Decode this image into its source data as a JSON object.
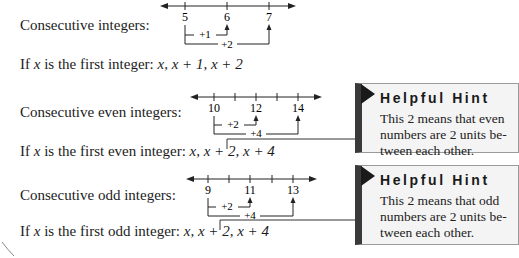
{
  "sections": [
    {
      "id": "consecutive",
      "label": "Consecutive integers:",
      "formula_prefix": "If ",
      "formula_var": "x",
      "formula_mid": " is the first integer: ",
      "formula_terms": "x, x + 1, x + 2",
      "number_line": {
        "tick_labels": [
          "5",
          "6",
          "7"
        ],
        "step_labels": [
          "+1",
          "+2"
        ]
      }
    },
    {
      "id": "even",
      "label": "Consecutive even integers:",
      "formula_prefix": "If ",
      "formula_var": "x",
      "formula_mid": " is the first even integer: ",
      "formula_terms": "x, x + 2, x + 4",
      "number_line": {
        "tick_labels": [
          "10",
          "12",
          "14"
        ],
        "step_labels": [
          "+2",
          "+4"
        ]
      },
      "hint": {
        "title": "Helpful Hint",
        "body": "This 2 means that even numbers are 2 units be- tween each other."
      }
    },
    {
      "id": "odd",
      "label": "Consecutive odd integers:",
      "formula_prefix": "If ",
      "formula_var": "x",
      "formula_mid": " is the first odd integer: ",
      "formula_terms": "x, x + 2, x + 4",
      "number_line": {
        "tick_labels": [
          "9",
          "11",
          "13"
        ],
        "step_labels": [
          "+2",
          "+4"
        ]
      },
      "hint": {
        "title": "Helpful Hint",
        "body": "This 2 means that odd numbers are 2 units be- tween each other."
      }
    }
  ],
  "colors": {
    "text": "#1c1c1c",
    "hint_bg": "#f4f4f4",
    "hint_bar": "#3a3a3a",
    "hint_border": "#9a9a9a"
  }
}
